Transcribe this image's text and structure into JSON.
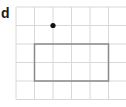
{
  "diagram": {
    "label": "d",
    "grid": {
      "origin_x": 16,
      "origin_y": 7,
      "cell_size": 18.5,
      "columns": 6,
      "rows": 5,
      "line_color": "#d8d8d8"
    },
    "point": {
      "col": 2,
      "row": 1,
      "color": "#111111"
    },
    "rectangle": {
      "col": 1,
      "row": 2,
      "width_cells": 4,
      "height_cells": 2,
      "stroke": "#8a8a8a"
    }
  }
}
